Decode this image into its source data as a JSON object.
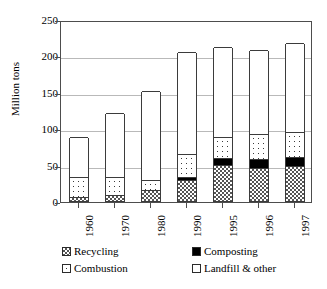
{
  "chart_data": {
    "type": "bar",
    "subtype": "stacked-bar",
    "title": "",
    "xlabel": "",
    "ylabel": "Million tons",
    "categories": [
      "1960",
      "1970",
      "1980",
      "1990",
      "1995",
      "1996",
      "1997"
    ],
    "ylim": [
      0,
      250
    ],
    "yticks": [
      0,
      50,
      100,
      150,
      200,
      250
    ],
    "ytick_labels": [
      "0",
      "50",
      "100",
      "150",
      "200",
      "250"
    ],
    "grid": true,
    "grid_axis": "y",
    "legend_position": "bottom",
    "stack_order_bottom_to_top": [
      "Recycling",
      "Composting",
      "Combustion",
      "Landfill & other"
    ],
    "series": [
      {
        "name": "Recycling",
        "values": [
          5.6,
          8.0,
          14.5,
          29.0,
          49.0,
          46.0,
          47.8
        ]
      },
      {
        "name": "Composting",
        "values": [
          0.0,
          0.0,
          0.0,
          4.2,
          9.6,
          11.9,
          12.1
        ]
      },
      {
        "name": "Combustion",
        "values": [
          27.0,
          25.0,
          13.7,
          31.9,
          29.2,
          33.5,
          34.9
        ]
      },
      {
        "name": "Landfill & other",
        "values": [
          55.4,
          88.0,
          122.8,
          139.9,
          123.2,
          116.6,
          122.2
        ]
      }
    ],
    "totals": [
      88,
      121,
      151,
      205,
      211,
      208,
      217
    ]
  },
  "axes": {
    "y_title": "Million tons",
    "y_tick_labels": [
      "250",
      "200",
      "150",
      "100",
      "50",
      "0"
    ],
    "x_tick_labels": [
      "1960",
      "1970",
      "1980",
      "1990",
      "1995",
      "1996",
      "1997"
    ]
  },
  "legend": {
    "items": [
      {
        "label": "Recycling",
        "pattern": "checkered",
        "color": "#555555"
      },
      {
        "label": "Composting",
        "pattern": "solid",
        "color": "#000000"
      },
      {
        "label": "Combustion",
        "pattern": "dotted",
        "color": "#3b3b3b"
      },
      {
        "label": "Landfill & other",
        "pattern": "empty",
        "color": "#ffffff"
      }
    ]
  },
  "colors": {
    "axis": "#4d4d4d",
    "grid": "#b9b9b9",
    "bar_outline": "#3b3b3b",
    "background": "#ffffff",
    "text": "#000000"
  }
}
